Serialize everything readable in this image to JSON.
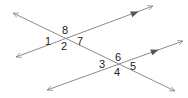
{
  "diagram": {
    "colors": {
      "line": "#8c8c8c",
      "arrow": "#555555",
      "label": "#222222",
      "background": "#ffffff"
    },
    "lines": [
      {
        "name": "upper-parallel-line",
        "x1": 16,
        "y1": 57,
        "x2": 153,
        "y2": 6,
        "parallel_marker": {
          "x": 135,
          "y": 13
        }
      },
      {
        "name": "lower-parallel-line",
        "x1": 47,
        "y1": 90,
        "x2": 183,
        "y2": 41,
        "parallel_marker": {
          "x": 155,
          "y": 51
        }
      },
      {
        "name": "transversal-line",
        "x1": 13,
        "y1": 13,
        "x2": 175,
        "y2": 91
      }
    ],
    "angle_labels": [
      {
        "id": "1",
        "text": "1",
        "x": 45,
        "y": 45
      },
      {
        "id": "2",
        "text": "2",
        "x": 61,
        "y": 50
      },
      {
        "id": "7",
        "text": "7",
        "x": 77,
        "y": 45
      },
      {
        "id": "8",
        "text": "8",
        "x": 62,
        "y": 34
      },
      {
        "id": "3",
        "text": "3",
        "x": 99,
        "y": 68
      },
      {
        "id": "4",
        "text": "4",
        "x": 114,
        "y": 76
      },
      {
        "id": "5",
        "text": "5",
        "x": 130,
        "y": 70
      },
      {
        "id": "6",
        "text": "6",
        "x": 115,
        "y": 61
      }
    ]
  }
}
